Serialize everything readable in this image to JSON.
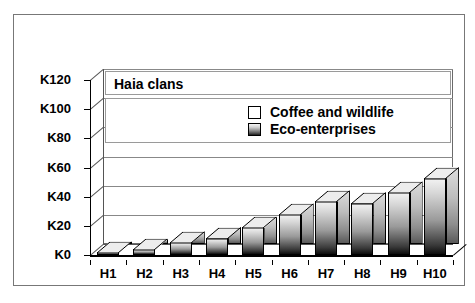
{
  "chart_data": {
    "type": "bar",
    "title": "Haia clans",
    "xlabel": "",
    "ylabel": "",
    "categories": [
      "H1",
      "H2",
      "H3",
      "H4",
      "H5",
      "H6",
      "H7",
      "H8",
      "H9",
      "H10"
    ],
    "series": [
      {
        "name": "Eco-enterprises",
        "values": [
          2,
          4,
          9,
          12,
          19,
          28,
          37,
          36,
          43,
          53
        ]
      }
    ],
    "legend": [
      {
        "label": "Coffee and wildlife",
        "swatch": "white"
      },
      {
        "label": "Eco-enterprises",
        "swatch": "gradient"
      }
    ],
    "legend_position": "inside-top",
    "ylim": [
      0,
      120
    ],
    "yticks": [
      "K0",
      "K20",
      "K40",
      "K60",
      "K80",
      "K100",
      "K120"
    ],
    "ytick_values": [
      0,
      20,
      40,
      60,
      80,
      100,
      120
    ],
    "grid": true,
    "colors": {
      "bar_light": "#f2f2f2",
      "bar_dark": "#0d0d0d",
      "bar_side": "#b5b5b5",
      "bar_top": "#e8e8e8",
      "gridline": "#888888",
      "axis": "#000000",
      "frame": "#777777",
      "background": "#ffffff"
    }
  }
}
